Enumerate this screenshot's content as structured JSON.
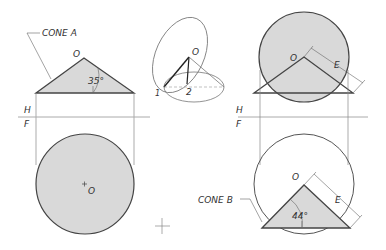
{
  "colors": {
    "line": "#444444",
    "thin": "#888888",
    "fill": "#d9d9d9",
    "ref_line": "#aaaaaa"
  },
  "labels": {
    "cone_a": "CONE A",
    "cone_b": "CONE B",
    "apex_o_top_left": "O",
    "apex_o_center": "O",
    "center_o_bottom_left": "O",
    "apex_o_top_right": "O",
    "apex_o_bottom_right": "O",
    "point_1": "1",
    "point_2": "2",
    "angle_a": "35°",
    "angle_b": "44°",
    "dim_e_top": "E",
    "dim_e_bottom": "E",
    "h_left": "H",
    "f_left": "F",
    "h_right": "H",
    "f_right": "F"
  }
}
